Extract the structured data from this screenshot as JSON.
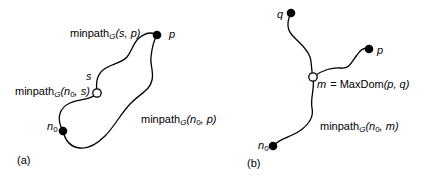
{
  "colors": {
    "ink": "#000000",
    "background": "#ffffff"
  },
  "panel_a": {
    "caption": "(a)",
    "node_labels": {
      "p": "p",
      "s": "s",
      "n0_base": "n",
      "n0_sub": "0"
    },
    "edge_labels": {
      "minpath_sp": {
        "prefix": "minpath",
        "graph_sub": "G",
        "args": "(s, p)"
      },
      "minpath_n0s": {
        "prefix": "minpath",
        "graph_sub": "G",
        "arg_open": "(n",
        "arg_sub": "0",
        "arg_rest": ", s)"
      },
      "minpath_n0p": {
        "prefix": "minpath",
        "graph_sub": "G",
        "arg_open": "(n",
        "arg_sub": "0",
        "arg_rest": ", p)"
      }
    }
  },
  "panel_b": {
    "caption": "(b)",
    "node_labels": {
      "q": "q",
      "p": "p",
      "n0_base": "n",
      "n0_sub": "0"
    },
    "m_label": {
      "m_var": "m",
      "equals": "= MaxDom",
      "args": "(p, q)"
    },
    "edge_labels": {
      "minpath_n0m": {
        "prefix": "minpath",
        "graph_sub": "G",
        "arg_open": "(n",
        "arg_sub": "0",
        "arg_rest": ", m)"
      }
    }
  }
}
